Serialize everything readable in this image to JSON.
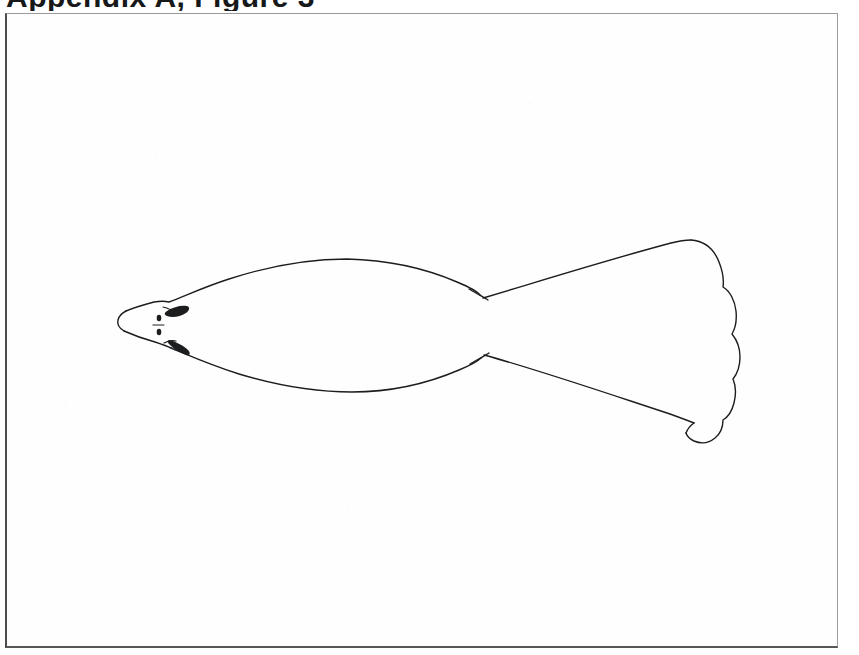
{
  "page": {
    "width": 859,
    "height": 655,
    "background_color": "#ffffff",
    "paper_color": "#fefefe",
    "ink_color": "#1b1d1f",
    "border_color": "#4d4d4d"
  },
  "heading": {
    "text": "Appendix A, Figure 3",
    "note": "clipped at top edge of scan; only bottom fragments of bold letters visible",
    "visible_fragments": [
      "p",
      "...",
      "g"
    ]
  },
  "frame": {
    "label": "figure-border-box",
    "left": 5,
    "top": 13,
    "width": 833,
    "height": 635
  },
  "figure": {
    "orientation": "head-left-tail-right",
    "stroke_width": 1.4,
    "parts": [
      {
        "name": "snout-tip",
        "x": 124,
        "y": 310
      },
      {
        "name": "head",
        "x": 150,
        "y": 310
      },
      {
        "name": "left-eye-mark",
        "x": 168,
        "y": 301
      },
      {
        "name": "right-eye-mark",
        "x": 170,
        "y": 329
      },
      {
        "name": "body-widest",
        "x": 330,
        "y": 310
      },
      {
        "name": "caudal-peduncle",
        "x": 478,
        "y": 312
      },
      {
        "name": "tail-fin-top-corner",
        "x": 688,
        "y": 230
      },
      {
        "name": "tail-fin-bottom-corner",
        "x": 697,
        "y": 418
      },
      {
        "name": "tail-fin-outer-edge",
        "x": 733,
        "y": 320
      }
    ],
    "tail_scallop_count": 5
  }
}
